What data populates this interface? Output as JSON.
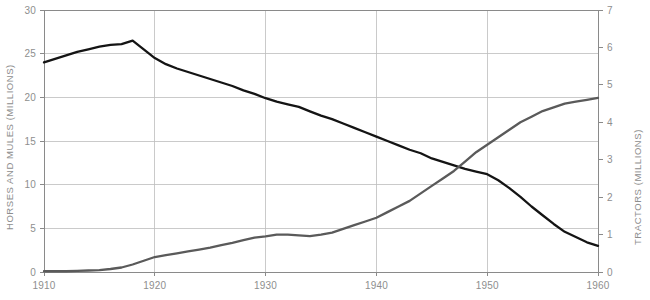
{
  "chart_data": {
    "type": "line",
    "title": "",
    "xlabel": "",
    "ylabel": "HORSES AND MULES (MILLIONS)",
    "y2label": "TRACTORS (MILLIONS)",
    "xlim": [
      1910,
      1960
    ],
    "ylim": [
      0,
      30
    ],
    "y2lim": [
      0,
      7
    ],
    "xticks": [
      1910,
      1920,
      1930,
      1940,
      1950,
      1960
    ],
    "xtick_labels": [
      "1910",
      "1920",
      "1930",
      "1940",
      "1950",
      "1960"
    ],
    "yticks": [
      0,
      5,
      10,
      15,
      20,
      25,
      30
    ],
    "ytick_labels": [
      "0",
      "5",
      "10",
      "15",
      "20",
      "25",
      "30"
    ],
    "y2ticks": [
      0,
      1,
      2,
      3,
      4,
      5,
      6,
      7
    ],
    "y2tick_labels": [
      "0",
      "1",
      "2",
      "3",
      "4",
      "5",
      "6",
      "7"
    ],
    "grid": true,
    "legend_position": "none",
    "colors": {
      "horses": "#141414",
      "tractors": "#5a5a5a",
      "grid": "#bdbdbd",
      "frame": "#8a8a8a",
      "text": "#8e8e8e",
      "background": "#ffffff"
    },
    "x": [
      1910,
      1911,
      1912,
      1913,
      1914,
      1915,
      1916,
      1917,
      1918,
      1919,
      1920,
      1921,
      1922,
      1923,
      1924,
      1925,
      1926,
      1927,
      1928,
      1929,
      1930,
      1931,
      1932,
      1933,
      1934,
      1935,
      1936,
      1937,
      1938,
      1939,
      1940,
      1941,
      1942,
      1943,
      1944,
      1945,
      1946,
      1947,
      1948,
      1949,
      1950,
      1951,
      1952,
      1953,
      1954,
      1955,
      1956,
      1957,
      1958,
      1959,
      1960
    ],
    "series": [
      {
        "name": "HORSES AND MULES (MILLIONS)",
        "axis": "left",
        "units": "millions",
        "color": "#141414",
        "values": [
          24.0,
          24.4,
          24.8,
          25.2,
          25.5,
          25.8,
          26.0,
          26.1,
          26.5,
          25.5,
          24.5,
          23.8,
          23.3,
          22.9,
          22.5,
          22.1,
          21.7,
          21.3,
          20.8,
          20.4,
          19.9,
          19.5,
          19.2,
          18.9,
          18.4,
          17.9,
          17.5,
          17.0,
          16.5,
          16.0,
          15.5,
          15.0,
          14.5,
          14.0,
          13.6,
          13.0,
          12.6,
          12.2,
          11.8,
          11.5,
          11.2,
          10.5,
          9.6,
          8.6,
          7.5,
          6.5,
          5.5,
          4.6,
          4.0,
          3.4,
          3.0
        ]
      },
      {
        "name": "TRACTORS (MILLIONS)",
        "axis": "right",
        "units": "millions",
        "color": "#5a5a5a",
        "values": [
          0.02,
          0.02,
          0.02,
          0.03,
          0.04,
          0.05,
          0.08,
          0.12,
          0.2,
          0.3,
          0.4,
          0.45,
          0.5,
          0.55,
          0.6,
          0.65,
          0.72,
          0.78,
          0.85,
          0.92,
          0.95,
          1.0,
          1.0,
          0.98,
          0.96,
          1.0,
          1.05,
          1.15,
          1.25,
          1.35,
          1.45,
          1.6,
          1.75,
          1.9,
          2.1,
          2.3,
          2.5,
          2.7,
          2.95,
          3.2,
          3.4,
          3.6,
          3.8,
          4.0,
          4.15,
          4.3,
          4.4,
          4.5,
          4.55,
          4.6,
          4.65
        ]
      }
    ]
  },
  "axes": {
    "left_title": "HORSES AND MULES (MILLIONS)",
    "right_title": "TRACTORS (MILLIONS)"
  }
}
